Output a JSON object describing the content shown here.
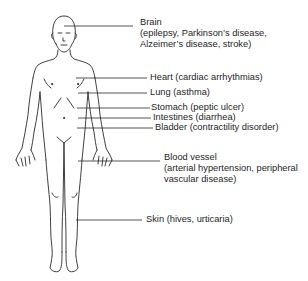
{
  "diagram": {
    "type": "anatomical-annotation",
    "line_color": "#2a2a2a",
    "labels": [
      {
        "id": "brain",
        "lines": [
          "Brain",
          "(epilepsy, Parkinson’s disease,",
          "Alzeimer’s disease, stroke)"
        ]
      },
      {
        "id": "heart",
        "lines": [
          "Heart (cardiac arrhythmias)"
        ]
      },
      {
        "id": "lung",
        "lines": [
          "Lung (asthma)"
        ]
      },
      {
        "id": "stomach",
        "lines": [
          "Stomach (peptic ulcer)"
        ]
      },
      {
        "id": "intestines",
        "lines": [
          "Intestines (diarrhea)"
        ]
      },
      {
        "id": "bladder",
        "lines": [
          "Bladder (contractility disorder)"
        ]
      },
      {
        "id": "blood-vessel",
        "lines": [
          "Blood vessel",
          "(arterial hypertension, peripheral",
          "vascular disease)"
        ]
      },
      {
        "id": "skin",
        "lines": [
          "Skin (hives, urticaria)"
        ]
      }
    ]
  }
}
